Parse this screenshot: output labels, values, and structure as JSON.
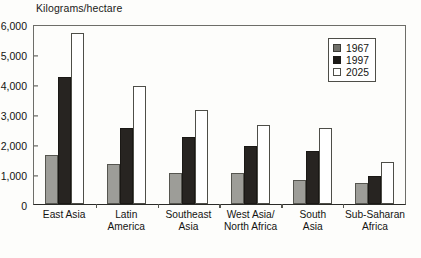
{
  "chart": {
    "axis_title": "Kilograms/hectare",
    "caption": ""
  },
  "legend": {
    "position": "top-right",
    "items": [
      {
        "label": "1967",
        "color": "#6f6f6a"
      },
      {
        "label": "1997",
        "color": "#1d1b18"
      },
      {
        "label": "2025",
        "color": "#ffffff"
      }
    ]
  },
  "chart_data": {
    "type": "bar",
    "title": "",
    "xlabel": "",
    "ylabel": "Kilograms/hectare",
    "ylim": [
      0,
      6000
    ],
    "yticks": [
      "0",
      "1,000",
      "2,000",
      "3,000",
      "4,000",
      "5,000",
      "6,000"
    ],
    "ytick_values": [
      0,
      1000,
      2000,
      3000,
      4000,
      5000,
      6000
    ],
    "grid": false,
    "legend_position": "top-right",
    "categories": [
      "East Asia",
      "Latin\nAmerica",
      "Southeast\nAsia",
      "West Asia/\nNorth Africa",
      "South\nAsia",
      "Sub-Saharan\nAfrica"
    ],
    "series": [
      {
        "name": "1967",
        "color": "#9d9d98",
        "values": [
          1650,
          1320,
          1050,
          1040,
          800,
          700
        ]
      },
      {
        "name": "1997",
        "color": "#272421",
        "values": [
          4220,
          2520,
          2220,
          1930,
          1780,
          920
        ]
      },
      {
        "name": "2025",
        "color": "#ffffff",
        "values": [
          5700,
          3950,
          3120,
          2620,
          2520,
          1410
        ]
      }
    ]
  }
}
